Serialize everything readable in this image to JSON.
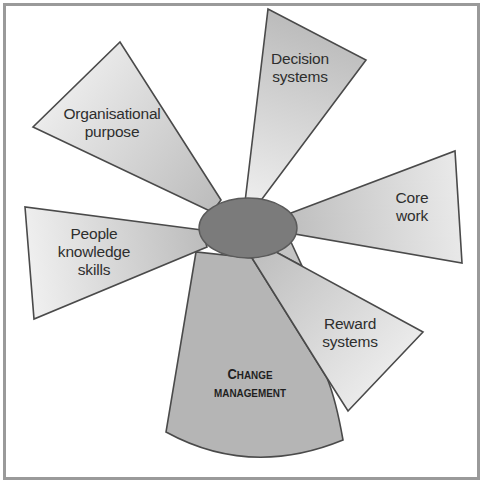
{
  "diagram": {
    "type": "hub-and-spoke",
    "hub": {
      "label": "",
      "color": "#7b7b7b"
    },
    "colors": {
      "frame": "#9a9a9a",
      "outline": "#4a4a4a",
      "blade_inner": "#bdbdbd",
      "blade_outer": "#eeeeee",
      "change_fill": "#b5b5b5",
      "text": "#2e2e2e"
    },
    "spokes": [
      {
        "id": "organisational-purpose",
        "lines": [
          "Organisational",
          "purpose"
        ]
      },
      {
        "id": "decision-systems",
        "lines": [
          "Decision",
          "systems"
        ]
      },
      {
        "id": "core-work",
        "lines": [
          "Core",
          "work"
        ]
      },
      {
        "id": "reward-systems",
        "lines": [
          "Reward",
          "systems"
        ]
      },
      {
        "id": "people-knowledge-skills",
        "lines": [
          "People",
          "knowledge",
          "skills"
        ]
      }
    ],
    "base": {
      "id": "change-management",
      "line1_cap": "C",
      "line1_rest": "HANGE",
      "line2": "MANAGEMENT"
    }
  }
}
